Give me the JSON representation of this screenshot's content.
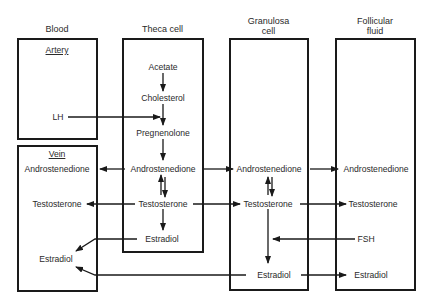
{
  "columns": {
    "blood": "Blood",
    "theca": "Theca cell",
    "granulosa_line1": "Granulosa",
    "granulosa_line2": "cell",
    "follicular_line1": "Follicular",
    "follicular_line2": "fluid"
  },
  "blood": {
    "artery": "Artery",
    "vein": "Vein",
    "lh": "LH",
    "androstenedione": "Androstenedione",
    "testosterone": "Testosterone",
    "estradiol": "Estradiol"
  },
  "theca": {
    "acetate": "Acetate",
    "cholesterol": "Cholesterol",
    "pregnenolone": "Pregnenolone",
    "androstenedione": "Androstenedione",
    "testosterone": "Testosterone",
    "estradiol": "Estradiol"
  },
  "granulosa": {
    "androstenedione": "Androstenedione",
    "testosterone": "Testosterone",
    "estradiol": "Estradiol"
  },
  "follicular": {
    "androstenedione": "Androstenedione",
    "testosterone": "Testosterone",
    "estradiol": "Estradiol",
    "fsh": "FSH"
  }
}
